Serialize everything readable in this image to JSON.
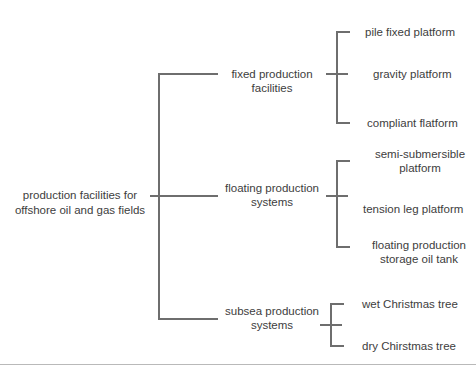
{
  "diagram": {
    "type": "bracket-tree",
    "orientation": "left-to-right",
    "line_color": "#6e6e6e",
    "text_color": "#3d3d3d",
    "background_color": "#ffffff",
    "rule_color": "#b9b9b9",
    "root": {
      "label": "production facilities for\noffshore oil and gas fields"
    },
    "branches": [
      {
        "label": "fixed production facilities",
        "leaves": [
          {
            "label": "pile fixed platform"
          },
          {
            "label": "gravity platform"
          },
          {
            "label": "compliant flatform"
          }
        ]
      },
      {
        "label": "floating production\nsystems",
        "leaves": [
          {
            "label": "semi-submersible\nplatform"
          },
          {
            "label": "tension leg platform"
          },
          {
            "label": "floating production\nstorage oil tank"
          }
        ]
      },
      {
        "label": "subsea production\nsystems",
        "leaves": [
          {
            "label": "wet Christmas tree"
          },
          {
            "label": "dry Chirstmas tree"
          }
        ]
      }
    ]
  }
}
